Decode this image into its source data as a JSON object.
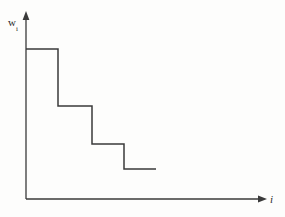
{
  "figure": {
    "background_color": "#fdfdfc",
    "line_color": "#3a3a3a",
    "label_color": "#2b2b2b",
    "width": 285,
    "height": 217
  },
  "axes": {
    "y_label_main": "w",
    "y_label_sub": "i",
    "x_label": "i",
    "y_axis": {
      "x": 26,
      "y_top": 14,
      "y_bottom": 199,
      "arrow": "up"
    },
    "x_axis": {
      "y": 199,
      "x_left": 26,
      "x_right": 265,
      "arrow": "right"
    }
  },
  "chart_data": {
    "type": "line",
    "title": "",
    "xlabel": "i",
    "ylabel": "w_i",
    "subtype": "step-decreasing",
    "grid": false,
    "legend": null,
    "x_tick_labels": [],
    "y_tick_labels": [],
    "xlim": [
      0,
      6
    ],
    "ylim": [
      0,
      5
    ],
    "categories": [
      "1",
      "2",
      "3",
      "4"
    ],
    "values": [
      4.05,
      2.5,
      1.48,
      0.8
    ],
    "steps": [
      {
        "index": 1,
        "x_start": 26,
        "x_end": 58,
        "y": 49,
        "value": 4.05
      },
      {
        "index": 2,
        "x_start": 58,
        "x_end": 92,
        "y": 106,
        "value": 2.5
      },
      {
        "index": 3,
        "x_start": 92,
        "x_end": 124,
        "y": 144,
        "value": 1.48
      },
      {
        "index": 4,
        "x_start": 124,
        "x_end": 156,
        "y": 169,
        "value": 0.8
      }
    ],
    "path_points": "26,49 58,49 58,106 92,106 92,144 124,144 124,169 156,169",
    "annotations": []
  }
}
